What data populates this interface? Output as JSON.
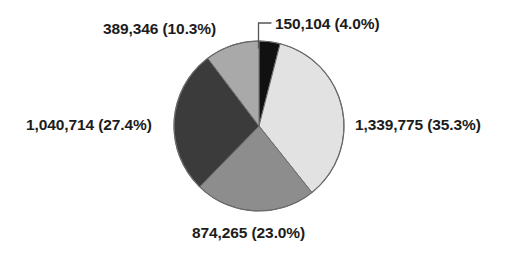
{
  "chart_data": {
    "type": "pie",
    "title": "",
    "subtitle": "",
    "xlabel": "",
    "ylabel": "",
    "legend_position": "none",
    "grid": false,
    "total": 3794204,
    "start_angle_deg": 0,
    "direction": "clockwise",
    "categories": [
      "150,104 (4.0%)",
      "1,339,775 (35.3%)",
      "874,265 (23.0%)",
      "1,040,714 (27.4%)",
      "389,346 (10.3%)"
    ],
    "values": [
      150104,
      1339775,
      874265,
      1040714,
      389346
    ],
    "percents": [
      4.0,
      35.3,
      23.0,
      27.4,
      10.3
    ],
    "colors": [
      "#111111",
      "#e2e2e2",
      "#8d8d8d",
      "#3b3b3b",
      "#a9a9a9"
    ],
    "slices": [
      {
        "id": "slice-150104",
        "value": 150104,
        "value_text": "150,104",
        "percent": 4.0,
        "percent_text": "(4.0%)",
        "label": "150,104 (4.0%)",
        "color": "#111111",
        "start_deg": 0,
        "end_deg": 14.4,
        "has_leader_line": true
      },
      {
        "id": "slice-1339775",
        "value": 1339775,
        "value_text": "1,339,775",
        "percent": 35.3,
        "percent_text": "(35.3%)",
        "label": "1,339,775 (35.3%)",
        "color": "#e2e2e2",
        "start_deg": 14.4,
        "end_deg": 141.5,
        "has_leader_line": false
      },
      {
        "id": "slice-874265",
        "value": 874265,
        "value_text": "874,265",
        "percent": 23.0,
        "percent_text": "(23.0%)",
        "label": "874,265 (23.0%)",
        "color": "#8d8d8d",
        "start_deg": 141.5,
        "end_deg": 224.3,
        "has_leader_line": false
      },
      {
        "id": "slice-1040714",
        "value": 1040714,
        "value_text": "1,040,714",
        "percent": 27.4,
        "percent_text": "(27.4%)",
        "label": "1,040,714 (27.4%)",
        "color": "#3b3b3b",
        "start_deg": 224.3,
        "end_deg": 322.9,
        "has_leader_line": false
      },
      {
        "id": "slice-389346",
        "value": 389346,
        "value_text": "389,346",
        "percent": 10.3,
        "percent_text": "(10.3%)",
        "label": "389,346 (10.3%)",
        "color": "#a9a9a9",
        "start_deg": 322.9,
        "end_deg": 360,
        "has_leader_line": false
      }
    ]
  },
  "labels": {
    "a": "389,346 (10.3%)",
    "b": "150,104 (4.0%)",
    "c": "1,339,775 (35.3%)",
    "d": "874,265 (23.0%)",
    "e": "1,040,714 (27.4%)"
  },
  "style": {
    "background": "#ffffff",
    "outline": "#6b6b6b",
    "text": "#1c1c1c",
    "leader_line": "#555555"
  }
}
